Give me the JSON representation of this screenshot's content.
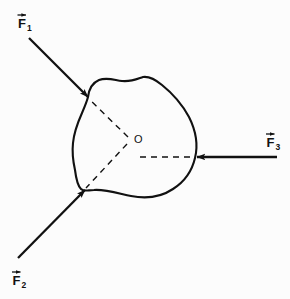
{
  "figure": {
    "type": "physics-free-body-diagram",
    "background_color": "#fcfcfc",
    "stroke_color": "#111111",
    "width": 290,
    "height": 299
  },
  "body_outline": {
    "name": "rigid-body-blob",
    "path": "M 88 97 C 89 89 92 83 99 80 C 107 77 114 80 122 81 C 131 82 137 79 143 77 C 150 76 156 80 162 85 C 172 93 182 104 189 117 C 196 131 198 146 195 158 C 192 171 184 182 173 189 C 161 197 146 199 131 196 C 117 193 104 189 94 190 C 88 190 84 192 81 189 C 77 185 76 178 75 170 C 73 161 72 152 73 143 C 74 132 78 122 82 113 C 85 106 87 101 88 97 Z"
  },
  "center_point": {
    "label": "O",
    "x": 130,
    "y": 140,
    "label_x": 134,
    "label_y": 143
  },
  "vectors": [
    {
      "id": "F1",
      "label": "F",
      "subscript": "1",
      "label_x": 19,
      "label_y": 27,
      "tail_x": 29,
      "tail_y": 38,
      "head_x": 88,
      "head_y": 97,
      "direction": "down-right",
      "contact_x": 88,
      "contact_y": 97
    },
    {
      "id": "F2",
      "label": "F",
      "subscript": "2",
      "label_x": 13,
      "label_y": 285,
      "tail_x": 18,
      "tail_y": 258,
      "head_x": 85,
      "head_y": 190,
      "direction": "up-right",
      "contact_x": 85,
      "contact_y": 190
    },
    {
      "id": "F3",
      "label": "F",
      "subscript": "3",
      "label_x": 267,
      "label_y": 146,
      "tail_x": 277,
      "tail_y": 157,
      "head_x": 197,
      "head_y": 157,
      "direction": "left",
      "contact_x": 197,
      "contact_y": 157
    }
  ],
  "dashed_lines": [
    {
      "id": "line-of-action-F1",
      "from_x": 128,
      "from_y": 137,
      "to_x": 89,
      "to_y": 99
    },
    {
      "id": "line-of-action-F2",
      "from_x": 127,
      "from_y": 144,
      "to_x": 86,
      "to_y": 188
    },
    {
      "id": "line-of-action-F3",
      "from_x": 140,
      "from_y": 157,
      "to_x": 196,
      "to_y": 157
    }
  ]
}
